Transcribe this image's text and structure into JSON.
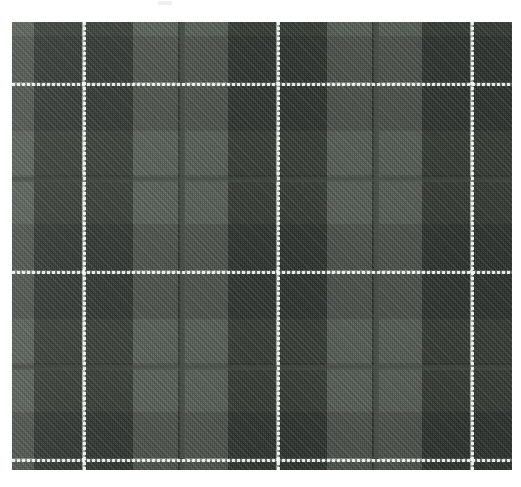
{
  "page": {
    "title": "Tartan Fabric Swatch",
    "background_color": "#ffffff",
    "width": 521,
    "height": 487
  },
  "top_strip": {
    "label": "",
    "mark_label": ""
  },
  "swatch": {
    "label": "Grey-green tartan plaid weave",
    "left": 12,
    "top": 22,
    "width": 500,
    "height": 448,
    "weave": "2/2 twill",
    "repeat_px": 148
  },
  "palette": {
    "light_green": "#787e78",
    "mid_green": "#4a4f4a",
    "dark_green": "#343a36",
    "navy_black": "#22252a",
    "guard_white": "#f2f4f2",
    "background": "#ffffff"
  },
  "chart_data": {
    "type": "heatmap",
    "xlabel": "warp position (px)",
    "ylabel": "weft position (px)",
    "grid": false,
    "legend": "none",
    "xlim": [
      0,
      500
    ],
    "ylim": [
      0,
      448
    ],
    "categories": [
      "light_green",
      "mid_green",
      "dark_green",
      "navy_black",
      "guard_white"
    ],
    "warp_sett": [
      {
        "color": "#787e78",
        "start": 0,
        "width": 22
      },
      {
        "color": "#4a4f4a",
        "start": 22,
        "width": 48
      },
      {
        "color": "#f2f4f2",
        "start": 70,
        "width": 3
      },
      {
        "color": "#4a4f4a",
        "start": 73,
        "width": 48
      },
      {
        "color": "#787e78",
        "start": 121,
        "width": 45
      },
      {
        "color": "#4a4f4a",
        "start": 166,
        "width": 5
      },
      {
        "color": "#787e78",
        "start": 171,
        "width": 45
      },
      {
        "color": "#4a4f4a",
        "start": 216,
        "width": 48
      },
      {
        "color": "#f2f4f2",
        "start": 264,
        "width": 3
      },
      {
        "color": "#4a4f4a",
        "start": 267,
        "width": 48
      },
      {
        "color": "#787e78",
        "start": 315,
        "width": 45
      },
      {
        "color": "#4a4f4a",
        "start": 360,
        "width": 5
      },
      {
        "color": "#787e78",
        "start": 365,
        "width": 45
      },
      {
        "color": "#4a4f4a",
        "start": 410,
        "width": 48
      },
      {
        "color": "#f2f4f2",
        "start": 458,
        "width": 3
      },
      {
        "color": "#4a4f4a",
        "start": 461,
        "width": 39
      }
    ],
    "weft_sett": [
      {
        "color": "#787e78",
        "start": 0,
        "height": 14
      },
      {
        "color": "#4a4f4a",
        "start": 14,
        "height": 46
      },
      {
        "color": "#f2f4f2",
        "start": 60,
        "height": 3
      },
      {
        "color": "#4a4f4a",
        "start": 63,
        "height": 46
      },
      {
        "color": "#787e78",
        "start": 109,
        "height": 44
      },
      {
        "color": "#4a4f4a",
        "start": 153,
        "height": 5
      },
      {
        "color": "#787e78",
        "start": 158,
        "height": 44
      },
      {
        "color": "#4a4f4a",
        "start": 202,
        "height": 46
      },
      {
        "color": "#f2f4f2",
        "start": 248,
        "height": 3
      },
      {
        "color": "#4a4f4a",
        "start": 251,
        "height": 46
      },
      {
        "color": "#787e78",
        "start": 297,
        "height": 44
      },
      {
        "color": "#4a4f4a",
        "start": 341,
        "height": 5
      },
      {
        "color": "#787e78",
        "start": 346,
        "height": 44
      },
      {
        "color": "#4a4f4a",
        "start": 390,
        "height": 46
      },
      {
        "color": "#f2f4f2",
        "start": 436,
        "height": 3
      },
      {
        "color": "#4a4f4a",
        "start": 439,
        "height": 9
      }
    ],
    "guard_lines_vertical_px": [
      71,
      265,
      459
    ],
    "guard_lines_horizontal_px": [
      61,
      249,
      437
    ],
    "thin_warp_lines_px": [
      168,
      362
    ],
    "thin_weft_lines_px": [
      155,
      343
    ]
  }
}
